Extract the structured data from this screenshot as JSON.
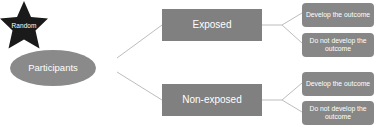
{
  "diagram": {
    "background_color": "#ffffff",
    "node_fill_color": "#808080",
    "star_fill_color": "#1a1a1a",
    "connector_color": "#bdbdbd",
    "label_color": "#ffffff"
  },
  "nodes": {
    "participants": {
      "label": "Participants",
      "shape": "ellipse"
    },
    "random": {
      "label": "Random",
      "shape": "star"
    },
    "exposed": {
      "label": "Exposed",
      "shape": "rectangle"
    },
    "non_exposed": {
      "label": "Non-exposed",
      "shape": "rectangle"
    }
  },
  "outcomes": {
    "exposed": [
      {
        "label": "Develop the outcome"
      },
      {
        "label": "Do not develop the outcome"
      }
    ],
    "non_exposed": [
      {
        "label": "Develop the outcome"
      },
      {
        "label": "Do not develop the outcome"
      }
    ]
  }
}
